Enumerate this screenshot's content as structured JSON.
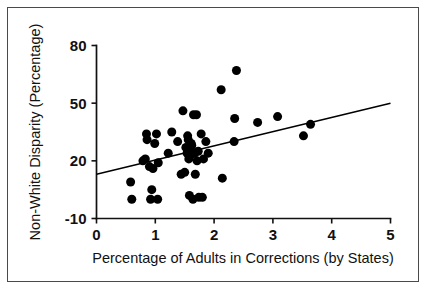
{
  "figure": {
    "border_color": "#4a4a4a",
    "background": "#ffffff",
    "point_color": "#000000",
    "axis_color": "#111111"
  },
  "chart_data": {
    "type": "scatter",
    "title": "",
    "xlabel": "Percentage of Adults in Corrections (by States)",
    "ylabel": "Non-White Disparity (Percentage)",
    "xlim": [
      0,
      5
    ],
    "ylim": [
      -10,
      80
    ],
    "xticks": [
      0,
      1,
      2,
      3,
      4,
      5
    ],
    "xticklabels": [
      "0",
      "1",
      "2",
      "3",
      "4",
      "5"
    ],
    "yticks": [
      -10,
      20,
      50,
      80
    ],
    "yticklabels": [
      "-10",
      "20",
      "50",
      "80"
    ],
    "grid": false,
    "legend": null,
    "marker": "filled-circle",
    "marker_size": 8,
    "points": [
      [
        0.58,
        9
      ],
      [
        0.6,
        0
      ],
      [
        0.79,
        20
      ],
      [
        0.83,
        21
      ],
      [
        0.85,
        34
      ],
      [
        0.86,
        31
      ],
      [
        0.9,
        17
      ],
      [
        0.92,
        0
      ],
      [
        0.94,
        5
      ],
      [
        0.96,
        16
      ],
      [
        0.99,
        29
      ],
      [
        1.02,
        34
      ],
      [
        1.04,
        0
      ],
      [
        1.05,
        19
      ],
      [
        1.22,
        24
      ],
      [
        1.28,
        35
      ],
      [
        1.38,
        30
      ],
      [
        1.44,
        13
      ],
      [
        1.47,
        46
      ],
      [
        1.5,
        14
      ],
      [
        1.52,
        27
      ],
      [
        1.54,
        24
      ],
      [
        1.55,
        33
      ],
      [
        1.56,
        31
      ],
      [
        1.57,
        21
      ],
      [
        1.58,
        2
      ],
      [
        1.59,
        25
      ],
      [
        1.6,
        23
      ],
      [
        1.61,
        29
      ],
      [
        1.62,
        28
      ],
      [
        1.64,
        0
      ],
      [
        1.65,
        44
      ],
      [
        1.67,
        24
      ],
      [
        1.68,
        13
      ],
      [
        1.7,
        44
      ],
      [
        1.71,
        20
      ],
      [
        1.73,
        25
      ],
      [
        1.74,
        1
      ],
      [
        1.78,
        34
      ],
      [
        1.8,
        1
      ],
      [
        1.82,
        21
      ],
      [
        1.86,
        30
      ],
      [
        1.9,
        24
      ],
      [
        2.12,
        57
      ],
      [
        2.14,
        11
      ],
      [
        2.34,
        30
      ],
      [
        2.35,
        42
      ],
      [
        2.38,
        67
      ],
      [
        2.74,
        40
      ],
      [
        3.08,
        43
      ],
      [
        3.52,
        33
      ],
      [
        3.64,
        39
      ]
    ],
    "fit_line": {
      "label": "regression line",
      "x": [
        0,
        5
      ],
      "y": [
        13,
        50
      ]
    }
  }
}
